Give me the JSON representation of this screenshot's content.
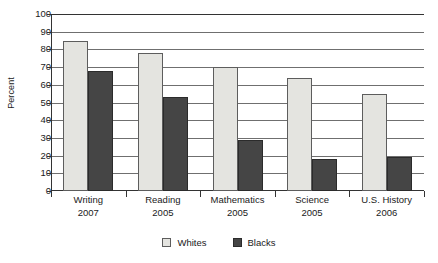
{
  "chart_data": {
    "type": "bar",
    "title": "",
    "xlabel": "",
    "ylabel": "Percent",
    "ylim": [
      0,
      100
    ],
    "ytick_step": 10,
    "yticks": [
      0,
      10,
      20,
      30,
      40,
      50,
      60,
      70,
      80,
      90,
      100
    ],
    "grid": true,
    "legend_position": "bottom-center",
    "categories": [
      "Writing 2007",
      "Reading 2005",
      "Mathematics 2005",
      "Science 2005",
      "U.S. History 2006"
    ],
    "category_parts": [
      {
        "subject": "Writing",
        "year": "2007"
      },
      {
        "subject": "Reading",
        "year": "2005"
      },
      {
        "subject": "Mathematics",
        "year": "2005"
      },
      {
        "subject": "Science",
        "year": "2005"
      },
      {
        "subject": "U.S. History",
        "year": "2006"
      }
    ],
    "series": [
      {
        "name": "Whites",
        "color": "#e4e4e0",
        "values": [
          85,
          78,
          70,
          64,
          55
        ]
      },
      {
        "name": "Blacks",
        "color": "#454545",
        "values": [
          68,
          53,
          29,
          18,
          19
        ]
      }
    ]
  },
  "legend": {
    "items": [
      {
        "label": "Whites",
        "swatch": "whites"
      },
      {
        "label": "Blacks",
        "swatch": "blacks"
      }
    ]
  },
  "axis": {
    "y_title": "Percent",
    "y_tick_labels": [
      "100",
      "90",
      "80",
      "70",
      "60",
      "50",
      "40",
      "30",
      "20",
      "10",
      "0"
    ]
  }
}
